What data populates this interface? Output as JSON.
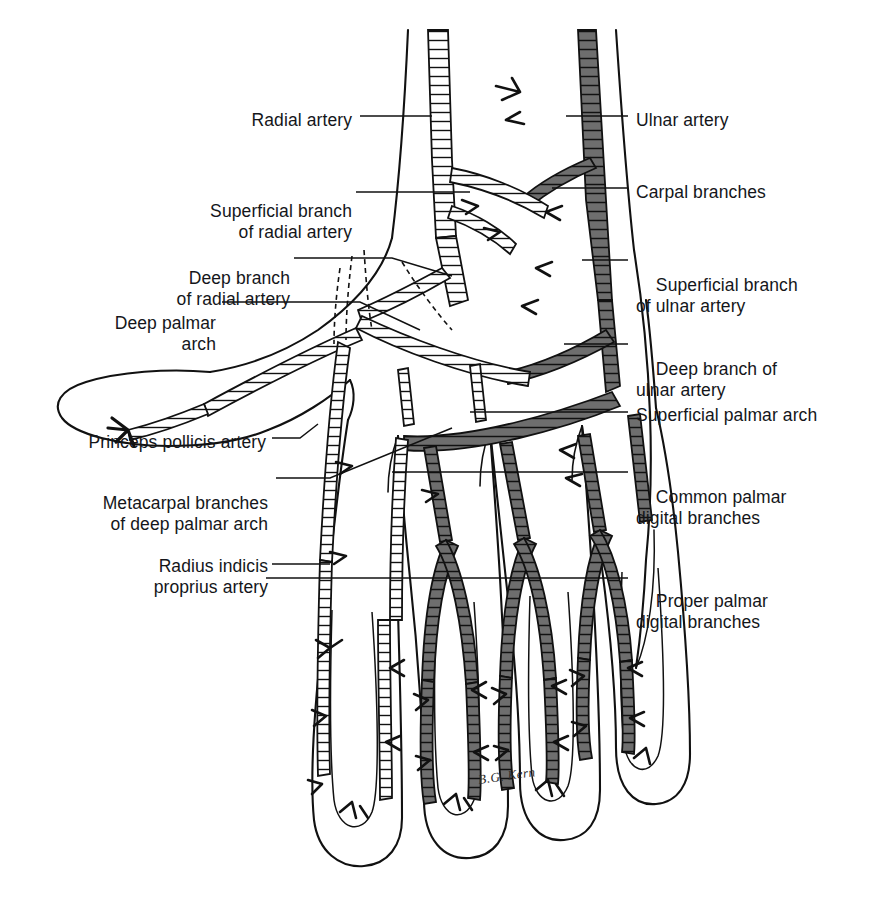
{
  "figure": {
    "background_color": "#ffffff",
    "ink_color": "#111111",
    "vessel_fill_radial": "#ffffff",
    "vessel_fill_ulnar": "#6e6e6e",
    "signature": "B.G. Kern"
  },
  "labels_left": [
    {
      "id": "radial-artery",
      "lines": [
        "Radial artery"
      ],
      "x": 222,
      "y": 110,
      "width": 130
    },
    {
      "id": "superficial-branch-radial",
      "lines": [
        "Superficial branch",
        "of radial artery"
      ],
      "x": 122,
      "y": 180,
      "width": 230
    },
    {
      "id": "deep-branch-radial",
      "lines": [
        "Deep branch",
        "of radial artery"
      ],
      "x": 92,
      "y": 247,
      "width": 198
    },
    {
      "id": "deep-palmar-arch",
      "lines": [
        "Deep palmar",
        "arch"
      ],
      "x": 36,
      "y": 292,
      "width": 180
    },
    {
      "id": "princeps-pollicis",
      "lines": [
        "Princeps pollicis artery"
      ],
      "x": 36,
      "y": 432,
      "width": 230
    },
    {
      "id": "metacarpal-branches",
      "lines": [
        "Metacarpal branches",
        "of deep palmar arch"
      ],
      "x": 46,
      "y": 472,
      "width": 222
    },
    {
      "id": "radius-indicis-proprius",
      "lines": [
        "Radius indicis",
        "proprius artery"
      ],
      "x": 116,
      "y": 535,
      "width": 152
    }
  ],
  "labels_right": [
    {
      "id": "ulnar-artery",
      "lines": [
        "Ulnar artery"
      ],
      "x": 636,
      "y": 110
    },
    {
      "id": "carpal-branches",
      "lines": [
        "Carpal branches"
      ],
      "x": 636,
      "y": 182
    },
    {
      "id": "superficial-branch-ulnar",
      "lines": [
        "Superficial branch",
        "of ulnar artery"
      ],
      "x": 636,
      "y": 254
    },
    {
      "id": "deep-branch-ulnar",
      "lines": [
        "Deep branch of",
        "ulnar artery"
      ],
      "x": 636,
      "y": 338
    },
    {
      "id": "superficial-palmar-arch",
      "lines": [
        "Superficial palmar arch"
      ],
      "x": 636,
      "y": 405
    },
    {
      "id": "common-palmar-digital",
      "lines": [
        "Common palmar",
        "digital branches"
      ],
      "x": 636,
      "y": 466
    },
    {
      "id": "proper-palmar-digital",
      "lines": [
        "Proper palmar",
        "digital branches"
      ],
      "x": 636,
      "y": 570
    }
  ]
}
